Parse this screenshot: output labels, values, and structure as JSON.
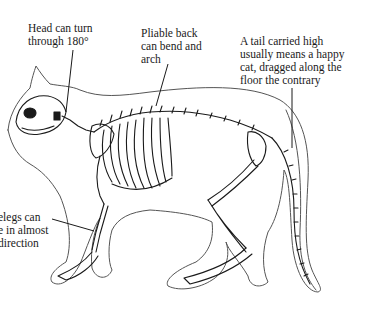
{
  "diagram": {
    "colors": {
      "background": "#ffffff",
      "ink": "#1a1a1a",
      "outline": "#555555"
    },
    "labels": {
      "head": {
        "lines": [
          "Head can turn",
          "through 180°"
        ]
      },
      "back": {
        "lines": [
          "Pliable back",
          "can bend and",
          "arch"
        ]
      },
      "tail": {
        "lines": [
          "A tail carried high",
          "usually means a happy",
          "cat, dragged along the",
          "floor the contrary"
        ]
      },
      "legs": {
        "lines": [
          "elegs can",
          "e in almost",
          "direction"
        ]
      }
    }
  }
}
